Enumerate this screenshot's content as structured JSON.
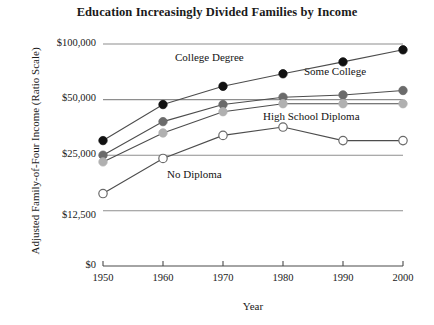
{
  "chart_data": {
    "type": "line",
    "title": "Education Increasingly Divided Families by Income",
    "xlabel": "Year",
    "ylabel": "Adjusted Family-of-Four Income (Ratio Scale)",
    "scale": "ratio (log) scale",
    "grid": true,
    "legend_position": "inline-annotations",
    "x": [
      1950,
      1960,
      1970,
      1980,
      1990,
      2000
    ],
    "xtick_labels": [
      "1950",
      "1960",
      "1970",
      "1980",
      "1990",
      "2000"
    ],
    "ytick_values": [
      100000,
      50000,
      25000,
      12500,
      0
    ],
    "ytick_labels": [
      "$100,000",
      "$50,000",
      "$25,000",
      "$12,500",
      "$0"
    ],
    "ylim": [
      0,
      115000
    ],
    "series": [
      {
        "name": "College Degree",
        "marker": "filled-circle",
        "color": "#111111",
        "values": [
          30000,
          47000,
          59000,
          69000,
          80000,
          93000
        ]
      },
      {
        "name": "Some College",
        "marker": "filled-circle",
        "color": "#6b6b6b",
        "values": [
          25000,
          38000,
          47000,
          51500,
          53000,
          56000
        ]
      },
      {
        "name": "High School Diploma",
        "marker": "filled-circle",
        "color": "#b0b0b0",
        "values": [
          23000,
          33000,
          43000,
          47500,
          47500,
          47500
        ]
      },
      {
        "name": "No Diploma",
        "marker": "open-circle",
        "color": "#ffffff",
        "values": [
          15500,
          24000,
          32000,
          35500,
          30000,
          30000
        ]
      }
    ],
    "annotations": [
      {
        "text": "College Degree",
        "x_px": 175,
        "y_px": 58
      },
      {
        "text": "Some College",
        "x_px": 304,
        "y_px": 72
      },
      {
        "text": "High School Diploma",
        "x_px": 263,
        "y_px": 117
      },
      {
        "text": "No Diploma",
        "x_px": 167,
        "y_px": 175
      }
    ]
  }
}
